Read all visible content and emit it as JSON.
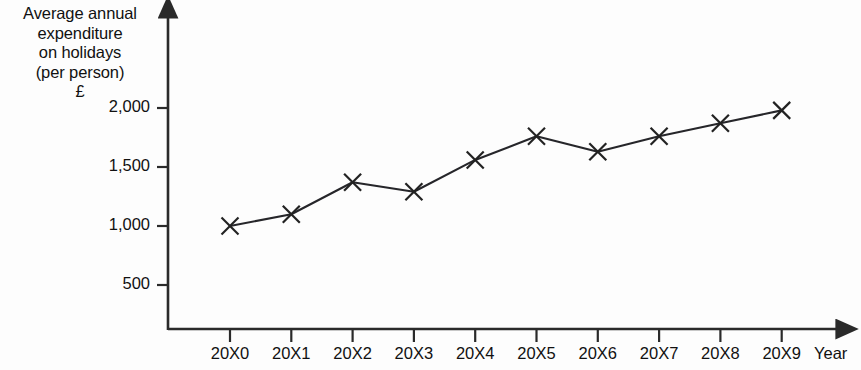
{
  "chart_data": {
    "type": "line",
    "title": "",
    "ylabel": "Average annual\nexpenditure\non holidays\n(per person)\n£",
    "xlabel": "Year",
    "categories": [
      "20X0",
      "20X1",
      "20X2",
      "20X3",
      "20X4",
      "20X5",
      "20X6",
      "20X7",
      "20X8",
      "20X9"
    ],
    "values": [
      1000,
      1100,
      1370,
      1290,
      1560,
      1760,
      1630,
      1760,
      1870,
      1980
    ],
    "series": [
      {
        "name": "Average annual expenditure on holidays (per person)",
        "values": [
          1000,
          1100,
          1370,
          1290,
          1560,
          1760,
          1630,
          1760,
          1870,
          1980
        ]
      }
    ],
    "ytick_labels": [
      "500",
      "1,000",
      "1,500",
      "2,000"
    ],
    "ytick_values": [
      500,
      1000,
      1500,
      2000
    ],
    "ylim": [
      0,
      2150
    ],
    "grid": false,
    "legend": "none",
    "marker": "x",
    "line_color": "#222222",
    "marker_color": "#222222",
    "axis_color": "#2a2a2a",
    "background_color": "#fdfdfd"
  },
  "axis": {
    "y_title": "Average annual\nexpenditure\non holidays\n(per person)\n£",
    "x_title": "Year"
  }
}
